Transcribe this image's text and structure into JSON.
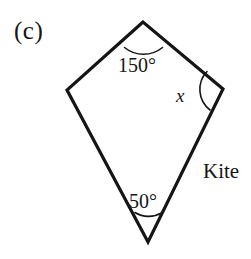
{
  "figure": {
    "part_label": "(c)",
    "shape_name": "Kite",
    "background_color": "#ffffff",
    "stroke_color": "#151515",
    "stroke_width": 3.2,
    "arc_stroke_width": 1.6,
    "vertices": {
      "top": {
        "x": 143,
        "y": 22
      },
      "left": {
        "x": 67,
        "y": 90
      },
      "right": {
        "x": 223,
        "y": 89
      },
      "bottom": {
        "x": 148,
        "y": 242
      }
    },
    "outline_path": "M143,22 L67,90 L148,242 L223,89 Z",
    "angles": [
      {
        "id": "top",
        "label": "150°",
        "value": 150,
        "vertex": {
          "x": 143,
          "y": 22
        },
        "arc_path": "M124.5,47.5 A 30 30 0 0 0 162.5,47.5",
        "label_position": {
          "x": 118,
          "y": 55
        }
      },
      {
        "id": "right",
        "label": "x",
        "value": null,
        "vertex": {
          "x": 223,
          "y": 89
        },
        "arc_path": "M207,71.5 A 26 26 0 0 0 210,110",
        "label_position": {
          "x": 176,
          "y": 86
        }
      },
      {
        "id": "bottom",
        "label": "50°",
        "value": 50,
        "vertex": {
          "x": 148,
          "y": 242
        },
        "arc_path": "M135,212.5 A 26 26 0 0 0 161.5,213",
        "label_position": {
          "x": 129,
          "y": 191
        }
      }
    ],
    "shape_name_position": {
      "x": 203,
      "y": 161
    },
    "part_label_position": {
      "x": 14,
      "y": 18
    }
  }
}
